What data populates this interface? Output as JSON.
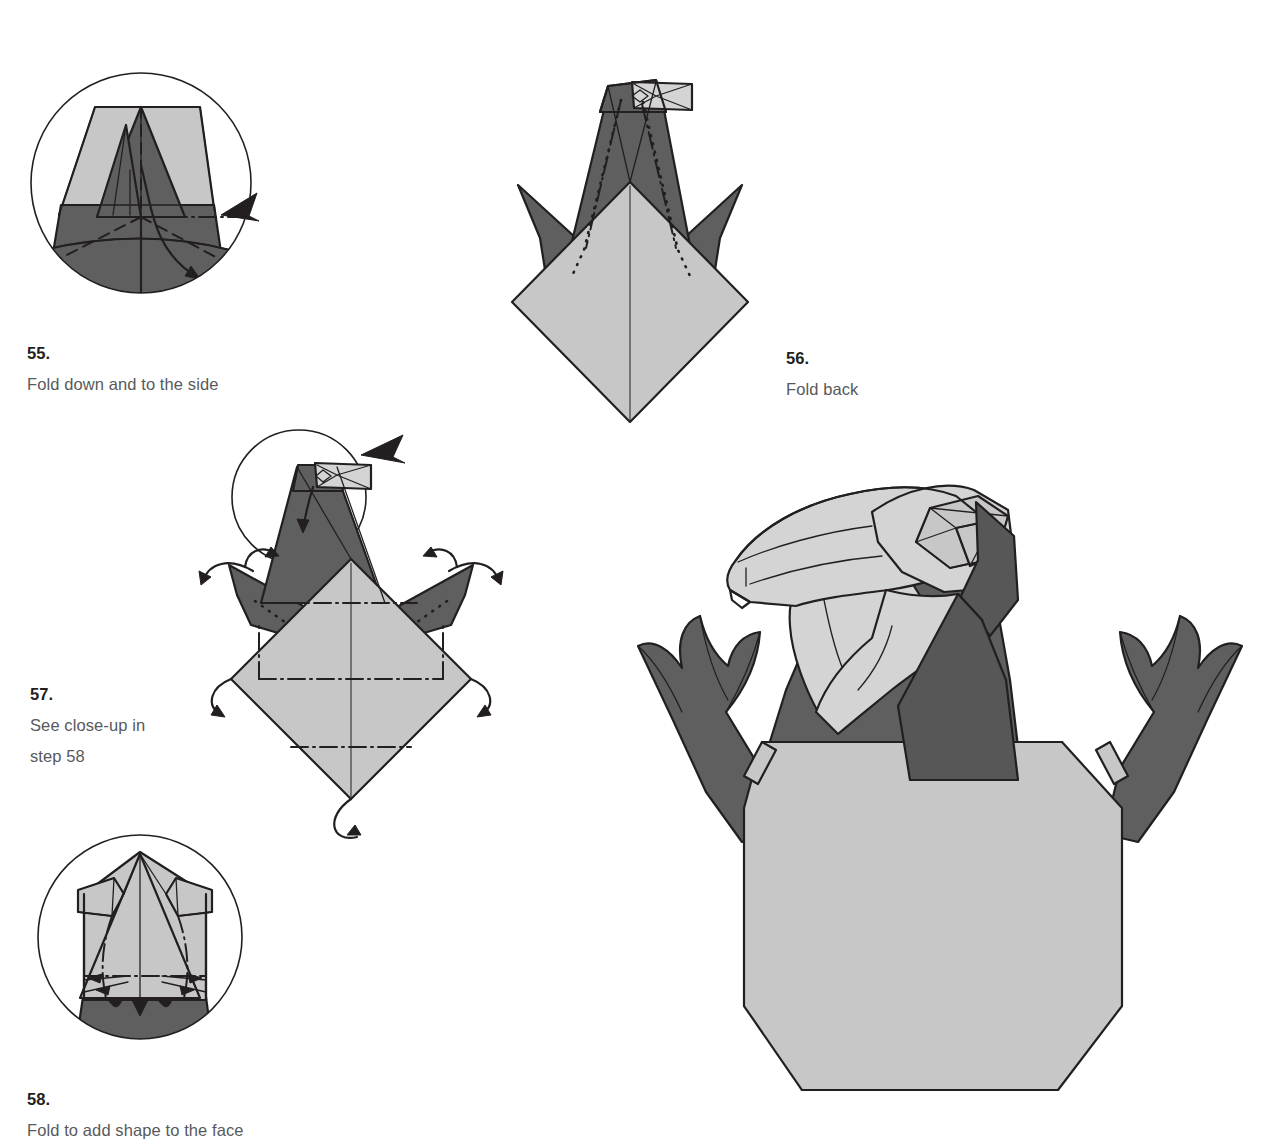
{
  "document": {
    "type": "origami-folding-instructions",
    "subject": "Eagle head",
    "page_background": "#ffffff",
    "palette": {
      "paper_light": "#c7c7c7",
      "paper_light_alt": "#d4d4d4",
      "paper_dark": "#5f5f5f",
      "ink": "#231f20",
      "caption_text": "#58595b"
    }
  },
  "steps": [
    {
      "number": "55.",
      "text": "Fold down and to the side",
      "caption_full": "55. Fold down and to the side",
      "figure": "close-up-circle-trapezoid-with-valley-folds",
      "annotations": [
        "fold-back-arrow",
        "curved-fold-arrow",
        "dashed-valley-folds",
        "dash-dot-mountain-fold"
      ]
    },
    {
      "number": "56.",
      "text": "Fold back",
      "caption_full": "56. Fold back",
      "figure": "bird-base-with-head-and-two-wing-points",
      "annotations": [
        "dotted-fold-lines",
        "dash-dot-fold-lines"
      ]
    },
    {
      "number": "57.",
      "text": "See close-up in\nstep 58",
      "caption_full": "57. See close-up in step 58",
      "figure": "diamond-body-with-outward-fold-arrows-and-magnifier",
      "annotations": [
        "magnifier-circle",
        "fold-back-arrow",
        "outward-curved-arrows",
        "dash-dot-fold-lines",
        "under-fold-arrow"
      ]
    },
    {
      "number": "58.",
      "text": "Fold to add shape to the face",
      "caption_full": "58. Fold to add shape to the face",
      "figure": "close-up-circle-of-face-shaping-folds",
      "annotations": [
        "dash-dot-fold-lines",
        "inward-pointing-arrows"
      ]
    }
  ],
  "final_model": {
    "name": "Finished eagle head",
    "description": "Completed origami eagle with open hooked beak, faceted crown, dark neck, two raised clawed wings and a large octagonal light body"
  }
}
